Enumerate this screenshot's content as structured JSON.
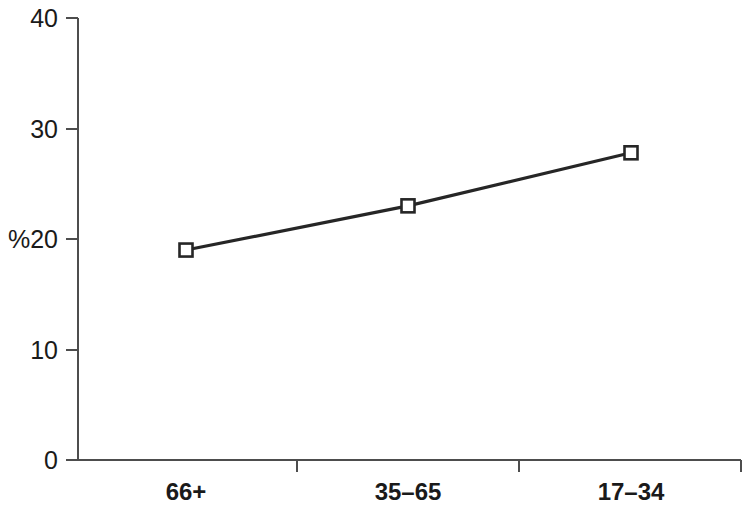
{
  "chart_data": {
    "type": "line",
    "title": "",
    "subtitle": "",
    "xlabel": "",
    "ylabel": "%",
    "categories": [
      "66+",
      "35–65",
      "17–34"
    ],
    "values": [
      19.0,
      23.0,
      27.8
    ],
    "series": [
      {
        "name": "",
        "values": [
          19.0,
          23.0,
          27.8
        ]
      }
    ],
    "ylim": [
      0,
      40
    ],
    "y_ticks": [
      0,
      10,
      20,
      30,
      40
    ],
    "y_tick_labels": [
      "0",
      "10",
      "20",
      "30",
      "40"
    ],
    "grid": false,
    "legend": false,
    "legend_position": "none",
    "marker": "open-square",
    "line_color": "#262626",
    "marker_fill": "#ffffff",
    "marker_edge_color": "#262626",
    "axis_color": "#4d4d4d",
    "background": "#ffffff"
  },
  "axes": {
    "y_axis_label": "%",
    "y_tick_0": "0",
    "y_tick_10": "10",
    "y_tick_20": "20",
    "y_tick_30": "30",
    "y_tick_40": "40",
    "x_cat_0": "66+",
    "x_cat_1": "35–65",
    "x_cat_2": "17–34"
  }
}
